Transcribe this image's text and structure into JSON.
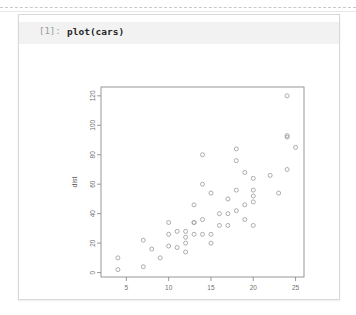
{
  "window": {
    "background_color": "#ffffff",
    "card_border_color": "#d8d8d8"
  },
  "cell": {
    "prompt_label": "[1]:",
    "code_text": "plot(cars)",
    "input_background": "#f2f2f2",
    "prompt_color": "#9a9a9a",
    "code_color": "#262626"
  },
  "chart_data": {
    "type": "scatter",
    "title": "",
    "xlabel": "speed",
    "ylabel": "dist",
    "xlim": [
      2,
      26
    ],
    "ylim": [
      -3,
      126
    ],
    "xticks": [
      5,
      10,
      15,
      20,
      25
    ],
    "yticks": [
      0,
      20,
      40,
      60,
      80,
      100,
      120
    ],
    "grid": false,
    "legend": null,
    "marker": "open-circle",
    "marker_color": "#9e9e9e",
    "axis_color": "#8d8d8d",
    "x": [
      4,
      4,
      7,
      7,
      8,
      9,
      10,
      10,
      10,
      11,
      11,
      12,
      12,
      12,
      12,
      13,
      13,
      13,
      13,
      14,
      14,
      14,
      14,
      15,
      15,
      15,
      16,
      16,
      17,
      17,
      17,
      18,
      18,
      18,
      18,
      19,
      19,
      19,
      20,
      20,
      20,
      20,
      20,
      22,
      23,
      24,
      24,
      24,
      24,
      25
    ],
    "y": [
      2,
      10,
      4,
      22,
      16,
      10,
      18,
      26,
      34,
      17,
      28,
      14,
      20,
      24,
      28,
      26,
      34,
      34,
      46,
      26,
      36,
      60,
      80,
      20,
      26,
      54,
      32,
      40,
      32,
      40,
      50,
      42,
      56,
      76,
      84,
      36,
      46,
      68,
      32,
      48,
      52,
      56,
      64,
      66,
      54,
      70,
      92,
      93,
      120,
      85
    ],
    "n_points": 50
  }
}
